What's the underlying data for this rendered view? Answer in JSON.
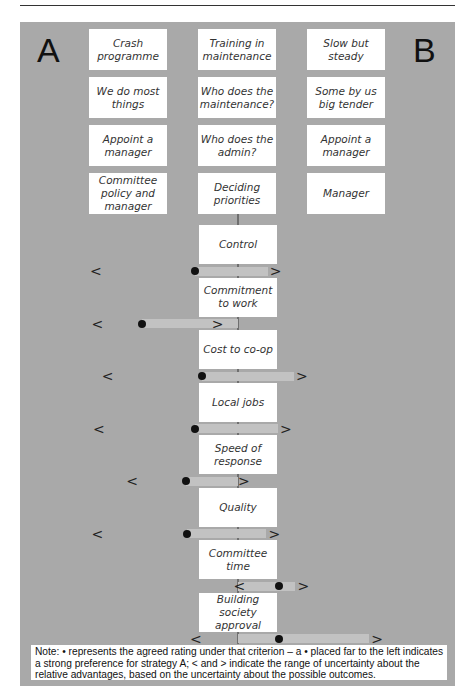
{
  "labels": {
    "strategy_a": "A",
    "strategy_b": "B"
  },
  "option_rows": [
    {
      "a": "Crash\nprogramme",
      "issue": "Training in\nmaintenance",
      "b": "Slow but\nsteady"
    },
    {
      "a": "We do most\nthings",
      "issue": "Who does the\nmaintenance?",
      "b": "Some by us\nbig tender"
    },
    {
      "a": "Appoint a\nmanager",
      "issue": "Who does the\nadmin?",
      "b": "Appoint a\nmanager"
    },
    {
      "a": "Committee\npolicy and\nmanager",
      "issue": "Deciding\npriorities",
      "b": "Manager"
    }
  ],
  "glyphs": {
    "low": "<",
    "high": ">"
  },
  "criteria_scale": "-1 = far left (strong preference for A), 0 = centre (neutral), +1 = far right (strong preference for B)",
  "criteria": [
    {
      "name": "Control",
      "low": -0.98,
      "rating": -0.3,
      "high": 0.26
    },
    {
      "name": "Commitment\nto work",
      "low": -0.97,
      "rating": -0.66,
      "high": -0.14
    },
    {
      "name": "Cost to co-op",
      "low": -0.9,
      "rating": -0.25,
      "high": 0.44
    },
    {
      "name": "Local jobs",
      "low": -0.96,
      "rating": -0.3,
      "high": 0.33
    },
    {
      "name": "Speed of\nresponse",
      "low": -0.73,
      "rating": -0.36,
      "high": 0.04
    },
    {
      "name": "Quality",
      "low": -0.97,
      "rating": -0.35,
      "high": 0.25
    },
    {
      "name": "Committee\ntime",
      "low": 0.01,
      "rating": 0.28,
      "high": 0.45
    },
    {
      "name": "Building society\napproval",
      "low": -0.29,
      "rating": 0.28,
      "high": 0.96
    }
  ],
  "note": "Note: • represents the agreed rating under that criterion – a • placed far to the left indicates a strong preference for strategy A; < and > indicate the range of uncertainty about the relative advantages, based on the uncertainty about the possible outcomes.",
  "chart_data": {
    "type": "scatter",
    "title": "",
    "xlabel": "Preference (A ← → B)",
    "ylabel": "",
    "xlim": [
      -1,
      1
    ],
    "categories": [
      "Control",
      "Commitment to work",
      "Cost to co-op",
      "Local jobs",
      "Speed of response",
      "Quality",
      "Committee time",
      "Building society approval"
    ],
    "series": [
      {
        "name": "agreed rating (•)",
        "values": [
          -0.3,
          -0.66,
          -0.25,
          -0.3,
          -0.36,
          -0.35,
          0.28,
          0.28
        ]
      },
      {
        "name": "uncertainty low (<)",
        "values": [
          -0.98,
          -0.97,
          -0.9,
          -0.96,
          -0.73,
          -0.97,
          0.01,
          -0.29
        ]
      },
      {
        "name": "uncertainty high (>)",
        "values": [
          0.26,
          -0.14,
          0.44,
          0.33,
          0.04,
          0.25,
          0.45,
          0.96
        ]
      }
    ],
    "legend": "bottom"
  }
}
